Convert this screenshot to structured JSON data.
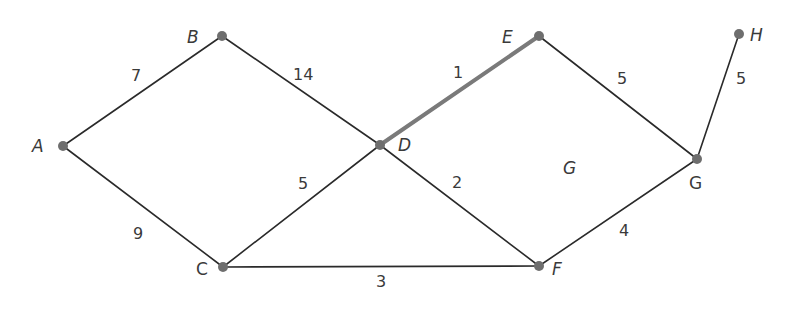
{
  "diagram": {
    "type": "weighted-graph",
    "colors": {
      "edge": "#2a2a2a",
      "highlight_edge": "#7a7a7a",
      "node": "#6e6e6e",
      "text": "#3a3a3a"
    },
    "nodes": [
      {
        "id": "A",
        "label": "A",
        "x": 63,
        "y": 146
      },
      {
        "id": "B",
        "label": "B",
        "x": 222,
        "y": 36
      },
      {
        "id": "C",
        "label": "C",
        "x": 223,
        "y": 267
      },
      {
        "id": "D",
        "label": "D",
        "x": 380,
        "y": 145
      },
      {
        "id": "E",
        "label": "E",
        "x": 539,
        "y": 36
      },
      {
        "id": "F",
        "label": "F",
        "x": 539,
        "y": 266
      },
      {
        "id": "G",
        "label": "G",
        "x": 697,
        "y": 159
      },
      {
        "id": "H",
        "label": "H",
        "x": 739,
        "y": 34
      }
    ],
    "edges": [
      {
        "from": "A",
        "to": "B",
        "weight": "7"
      },
      {
        "from": "B",
        "to": "D",
        "weight": "14"
      },
      {
        "from": "A",
        "to": "C",
        "weight": "9"
      },
      {
        "from": "C",
        "to": "D",
        "weight": "5"
      },
      {
        "from": "C",
        "to": "F",
        "weight": "3"
      },
      {
        "from": "D",
        "to": "E",
        "weight": "1",
        "highlighted": true
      },
      {
        "from": "D",
        "to": "F",
        "weight": "2"
      },
      {
        "from": "E",
        "to": "G",
        "weight": "5"
      },
      {
        "from": "F",
        "to": "G",
        "weight": "4"
      },
      {
        "from": "G",
        "to": "H",
        "weight": "5"
      }
    ],
    "graph_label": "G"
  }
}
